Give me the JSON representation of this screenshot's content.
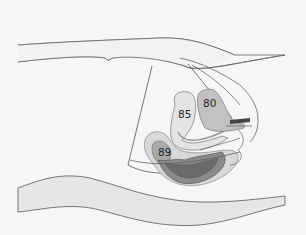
{
  "figure": {
    "type": "sagittal body diagram",
    "labels": [
      {
        "id": "region-80",
        "text": "80"
      },
      {
        "id": "region-85",
        "text": "85"
      },
      {
        "id": "region-89",
        "text": "89"
      }
    ]
  },
  "colors": {
    "background": "#f6f6f6",
    "outline": "#555555",
    "band": "#e6e6e6",
    "light_region": "#e8e8e8",
    "mid_region": "#c4c4c4",
    "dark_region": "#8a8a8a",
    "darkest_region": "#6a6a6a"
  }
}
